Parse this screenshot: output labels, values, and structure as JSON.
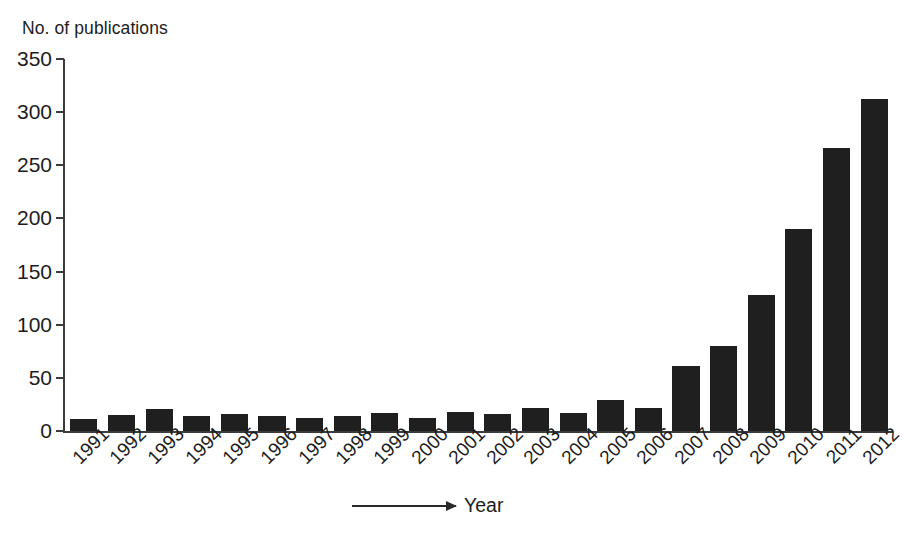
{
  "chart_data": {
    "type": "bar",
    "title": "",
    "ylabel": "No. of publications",
    "xlabel": "Year",
    "categories": [
      "1991",
      "1992",
      "1993",
      "1994",
      "1995",
      "1996",
      "1997",
      "1998",
      "1999",
      "2000",
      "2001",
      "2002",
      "2003",
      "2004",
      "2005",
      "2006",
      "2007",
      "2008",
      "2009",
      "2010",
      "2011",
      "2012"
    ],
    "values": [
      11,
      15,
      21,
      14,
      16,
      14,
      12,
      14,
      17,
      12,
      18,
      16,
      22,
      17,
      29,
      22,
      61,
      80,
      128,
      190,
      266,
      312
    ],
    "ylim": [
      0,
      350
    ],
    "ytick_labels": [
      "0",
      "50",
      "100",
      "150",
      "200",
      "250",
      "300",
      "350"
    ],
    "ytick_values": [
      0,
      50,
      100,
      150,
      200,
      250,
      300,
      350
    ],
    "grid": false,
    "legend": null,
    "bar_color": "#1f1f1f",
    "axis_color": "#3b3b3b",
    "background": "#ffffff",
    "xlabel_rotation": -45,
    "xlabel_has_arrow": true
  }
}
